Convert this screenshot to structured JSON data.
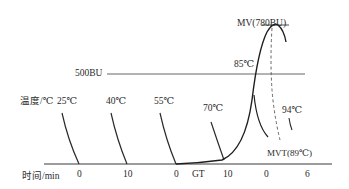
{
  "diagram": {
    "type": "brabender-viscosity-amylogram",
    "y_axis_label": "温度/℃",
    "x_axis_label": "时间/min",
    "reference_line": {
      "label": "500BU"
    },
    "peak": {
      "label": "MV(780BU)"
    },
    "peak_temperature_label": "85℃",
    "end_temperature_label": "94℃",
    "minimum_label": "MVT(89℃)",
    "temperature_markers": [
      "25℃",
      "40℃",
      "55℃",
      "70℃"
    ],
    "x_ticks": [
      {
        "label": "0"
      },
      {
        "label": "10"
      },
      {
        "label": "0"
      },
      {
        "label": "GT"
      },
      {
        "label": "10"
      },
      {
        "label": "0"
      },
      {
        "label": "6"
      }
    ],
    "colors": {
      "line": "#2a2a2a",
      "reference_line": "#555555",
      "background": "#ffffff"
    }
  }
}
